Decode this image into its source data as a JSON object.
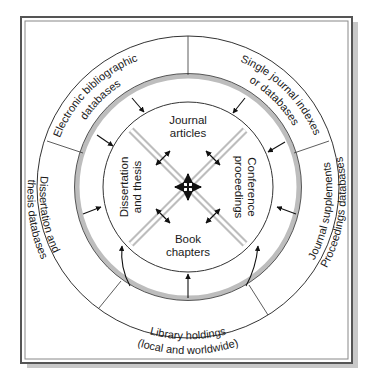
{
  "diagram": {
    "center_hub": "multi-directional-arrows",
    "inner_segments": {
      "top": [
        "Journal",
        "articles"
      ],
      "right": [
        "Conference",
        "proceedings"
      ],
      "bottom": [
        "Book",
        "chapters"
      ],
      "left": [
        "Dissertation",
        "and thesis"
      ]
    },
    "outer_segments": {
      "top_left": [
        "Electronic bibliographic",
        "databases"
      ],
      "top_right": [
        "Single journal indexes",
        "or databases"
      ],
      "right": [
        "Journal supplements",
        "Proceedings databases"
      ],
      "bottom": [
        "Library holdings",
        "(local and worldwide)"
      ],
      "left": [
        "Dissertation and",
        "thesis databases"
      ]
    },
    "colors": {
      "frame": "#555555",
      "shadow": "#c8c8c8",
      "ring_gray": "#bdbdbd",
      "line": "#333333",
      "background": "#ffffff"
    }
  }
}
